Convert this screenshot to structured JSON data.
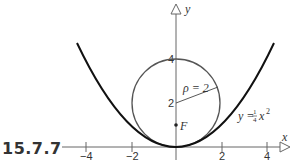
{
  "figure": {
    "label": "15.7.7",
    "x_axis_label": "x",
    "y_axis_label": "y",
    "x_ticks": [
      "−4",
      "−2",
      "2",
      "4"
    ],
    "y_ticks": [
      "2",
      "4"
    ],
    "radius_label": "ρ = 2",
    "focus_label": "F",
    "curve_label": {
      "lhs": "y = ",
      "frac_num": "1",
      "frac_den": "4",
      "var": "x",
      "exp": "2"
    }
  },
  "colors": {
    "parabola": "#111111",
    "circle": "#555555",
    "axis": "#666666"
  }
}
